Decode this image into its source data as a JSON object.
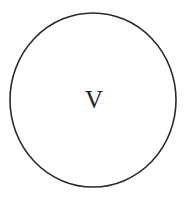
{
  "diagram": {
    "node": {
      "label": "V",
      "shape": "circle",
      "stroke_color": "#2a2a2a",
      "fill_color": "#ffffff"
    }
  }
}
